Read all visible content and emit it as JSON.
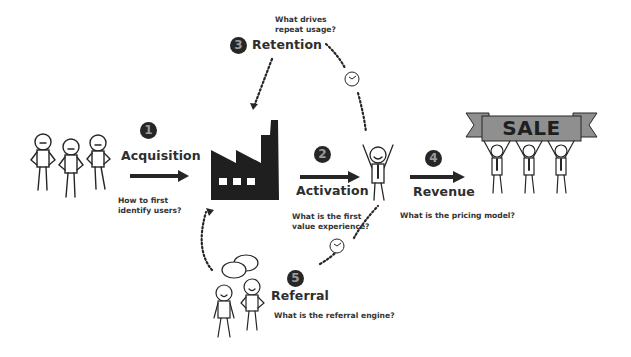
{
  "diagram": {
    "type": "AARRR pirate metrics funnel",
    "stages": [
      {
        "number": "1",
        "title": "Acquisition",
        "question_lines": [
          "How to first",
          "identify users?"
        ]
      },
      {
        "number": "2",
        "title": "Activation",
        "question_lines": [
          "What is the first",
          "value experience?"
        ]
      },
      {
        "number": "3",
        "title": "Retention",
        "question_lines": [
          "What drives",
          "repeat usage?"
        ]
      },
      {
        "number": "4",
        "title": "Revenue",
        "question_lines": [
          "What is the pricing model?"
        ]
      },
      {
        "number": "5",
        "title": "Referral",
        "question_lines": [
          "What is the referral engine?"
        ]
      }
    ],
    "banner_text": "SALE",
    "illustrations": [
      "group-of-three-users",
      "factory",
      "cheering-user",
      "users-holding-sale-banner",
      "two-users-talking"
    ],
    "colors": {
      "ink": "#262626",
      "badge_fill": "#262626",
      "badge_text": "#9a9a9a",
      "banner_fill": "#8f8f8f",
      "background": "#ffffff"
    }
  }
}
